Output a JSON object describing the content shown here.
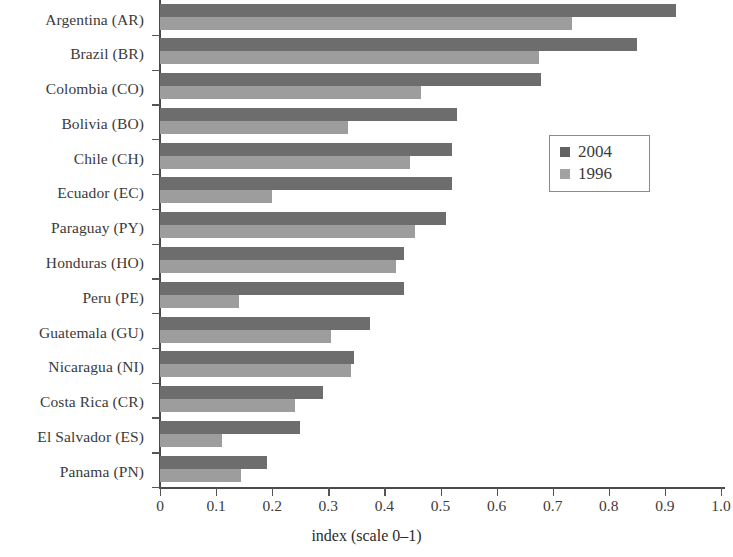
{
  "chart_data": {
    "type": "bar",
    "orientation": "horizontal",
    "title": "",
    "xlabel": "index (scale 0–1)",
    "ylabel": "",
    "xlim": [
      0,
      1.0
    ],
    "xticks": [
      "0",
      "0.1",
      "0.2",
      "0.3",
      "0.4",
      "0.5",
      "0.6",
      "0.7",
      "0.8",
      "0.9",
      "1.0"
    ],
    "xtick_values": [
      0,
      0.1,
      0.2,
      0.3,
      0.4,
      0.5,
      0.6,
      0.7,
      0.8,
      0.9,
      1.0
    ],
    "grid": false,
    "legend_position": "right",
    "categories": [
      "Argentina (AR)",
      "Brazil (BR)",
      "Colombia (CO)",
      "Bolivia (BO)",
      "Chile (CH)",
      "Ecuador (EC)",
      "Paraguay (PY)",
      "Honduras (HO)",
      "Peru (PE)",
      "Guatemala (GU)",
      "Nicaragua (NI)",
      "Costa Rica (CR)",
      "El Salvador (ES)",
      "Panama (PN)"
    ],
    "series": [
      {
        "name": "2004",
        "color": "#6d6d6d",
        "values": [
          0.92,
          0.85,
          0.68,
          0.53,
          0.52,
          0.52,
          0.51,
          0.435,
          0.435,
          0.375,
          0.345,
          0.29,
          0.25,
          0.19
        ]
      },
      {
        "name": "1996",
        "color": "#9d9d9d",
        "values": [
          0.735,
          0.675,
          0.465,
          0.335,
          0.445,
          0.2,
          0.455,
          0.42,
          0.14,
          0.305,
          0.34,
          0.24,
          0.11,
          0.145
        ]
      }
    ]
  },
  "legend": {
    "items": [
      {
        "label": "2004"
      },
      {
        "label": "1996"
      }
    ]
  }
}
